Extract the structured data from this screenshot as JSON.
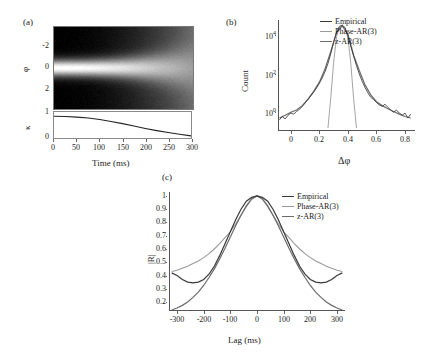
{
  "figure": {
    "panels": [
      {
        "id": "a",
        "label": "(a)"
      },
      {
        "id": "b",
        "label": "(b)"
      },
      {
        "id": "c",
        "label": "(c)"
      }
    ]
  },
  "panel_a": {
    "label": "(a)",
    "phi_axis_title": "φ",
    "kappa_axis_title": "κ",
    "xlabel": "Time (ms)",
    "phi_ticks": [
      "-2",
      "0",
      "2"
    ],
    "kappa_ticks": [
      "0",
      "1"
    ],
    "x_ticks": [
      "0",
      "50",
      "100",
      "150",
      "200",
      "250",
      "300"
    ]
  },
  "panel_b": {
    "label": "(b)",
    "ylabel": "Count",
    "xlabel": "Δφ",
    "y_ticks": [
      "10",
      "10",
      "10"
    ],
    "y_tick_exponents": [
      "0",
      "2",
      "4"
    ],
    "x_ticks": [
      "0",
      "0.2",
      "0.4",
      "0.6",
      "0.8"
    ],
    "legend": [
      {
        "label": "Empirical",
        "color": "#3a3a3a"
      },
      {
        "label": "Phase-AR(3)",
        "color": "#9a9a9a"
      },
      {
        "label": "z-AR(3)",
        "color": "#6b6b6b"
      }
    ]
  },
  "panel_c": {
    "label": "(c)",
    "ylabel": "|R|",
    "xlabel": "Lag (ms)",
    "y_ticks": [
      "1",
      "0.9",
      "0.8",
      "0.7",
      "0.6",
      "0.5",
      "0.4",
      "0.3",
      "0.2"
    ],
    "x_ticks": [
      "-300",
      "-200",
      "-100",
      "0",
      "100",
      "200",
      "300"
    ],
    "legend": [
      {
        "label": "Empirical",
        "color": "#3a3a3a"
      },
      {
        "label": "Phase-AR(3)",
        "color": "#9a9a9a"
      },
      {
        "label": "z-AR(3)",
        "color": "#6b6b6b"
      }
    ]
  },
  "chart_data": [
    {
      "type": "heatmap",
      "panel": "a",
      "title": "",
      "xlabel": "Time (ms)",
      "ylabel": "φ",
      "xlim": [
        0,
        300
      ],
      "ylim": [
        -3.14159,
        3.14159
      ],
      "y_ticks": [
        -2,
        0,
        2
      ],
      "x_ticks": [
        0,
        50,
        100,
        150,
        200,
        250,
        300
      ],
      "colormap": "gray",
      "description": "Phase density over time: bright concentrated band at phi=0 that broadens and fades with increasing time; dark bands near +/- pi edges early on fading to uniform mid-gray by 300 ms.",
      "grid": false
    },
    {
      "type": "line",
      "panel": "a-lower",
      "title": "",
      "xlabel": "Time (ms)",
      "ylabel": "κ",
      "xlim": [
        0,
        300
      ],
      "ylim": [
        0,
        1.15
      ],
      "y_ticks": [
        0,
        1
      ],
      "x_ticks": [
        0,
        50,
        100,
        150,
        200,
        250,
        300
      ],
      "series": [
        {
          "name": "kappa",
          "color": "#222222",
          "x": [
            0,
            25,
            50,
            75,
            100,
            125,
            150,
            175,
            200,
            225,
            250,
            275,
            300
          ],
          "values": [
            1.0,
            0.99,
            0.96,
            0.92,
            0.85,
            0.76,
            0.66,
            0.55,
            0.44,
            0.34,
            0.25,
            0.17,
            0.1
          ]
        }
      ],
      "grid": false
    },
    {
      "type": "line",
      "panel": "b",
      "title": "",
      "xlabel": "Δφ",
      "ylabel": "Count",
      "yscale": "log",
      "xlim": [
        -0.09,
        0.87
      ],
      "ylim": [
        0.12,
        60000
      ],
      "y_ticks": [
        1,
        100,
        10000
      ],
      "y_tick_labels": [
        "10^0",
        "10^2",
        "10^4"
      ],
      "x_ticks": [
        0,
        0.2,
        0.4,
        0.6,
        0.8
      ],
      "legend_position": "top-right",
      "series": [
        {
          "name": "Empirical",
          "color": "#3a3a3a",
          "description": "Noisy heavy-tailed distribution peaking near 3e4 at delta-phi 0.36, tails decaying to order 1 count at the edges",
          "x": [
            -0.08,
            -0.06,
            -0.04,
            -0.02,
            0.0,
            0.02,
            0.04,
            0.06,
            0.08,
            0.1,
            0.12,
            0.14,
            0.16,
            0.18,
            0.2,
            0.22,
            0.24,
            0.26,
            0.28,
            0.3,
            0.32,
            0.34,
            0.36,
            0.38,
            0.4,
            0.42,
            0.44,
            0.46,
            0.48,
            0.5,
            0.52,
            0.54,
            0.56,
            0.58,
            0.6,
            0.62,
            0.64,
            0.66,
            0.68,
            0.7,
            0.72,
            0.74,
            0.76,
            0.78,
            0.8,
            0.82,
            0.84
          ],
          "values": [
            0.4,
            0.6,
            0.45,
            0.7,
            0.9,
            0.8,
            1.1,
            1.4,
            2.0,
            3.0,
            4.5,
            7,
            11,
            18,
            32,
            60,
            130,
            330,
            1100,
            4200,
            14000,
            28000,
            33000,
            24000,
            9000,
            2600,
            800,
            260,
            95,
            40,
            19,
            10,
            6,
            4.5,
            3.2,
            2.4,
            2.0,
            2.6,
            1.8,
            1.3,
            1.0,
            1.3,
            0.9,
            0.7,
            0.9,
            0.5,
            0.8
          ]
        },
        {
          "name": "Phase-AR(3)",
          "color": "#9a9a9a",
          "description": "Narrow nearly-Gaussian peak, falls off vertically near 0.27 and 0.46",
          "x": [
            0.26,
            0.28,
            0.3,
            0.32,
            0.34,
            0.36,
            0.38,
            0.4,
            0.42,
            0.44,
            0.46
          ],
          "values": [
            0.15,
            6,
            400,
            8000,
            26000,
            32000,
            24000,
            7000,
            350,
            5,
            0.15
          ]
        },
        {
          "name": "z-AR(3)",
          "color": "#6b6b6b",
          "description": "Broad heavy-tailed curve closely tracking the empirical distribution",
          "x": [
            -0.08,
            -0.04,
            0.0,
            0.04,
            0.08,
            0.12,
            0.16,
            0.2,
            0.24,
            0.28,
            0.32,
            0.36,
            0.4,
            0.44,
            0.48,
            0.52,
            0.56,
            0.6,
            0.64,
            0.68,
            0.72,
            0.76,
            0.8,
            0.84
          ],
          "values": [
            0.5,
            0.7,
            1.0,
            1.3,
            2.2,
            4.8,
            12,
            36,
            180,
            1400,
            13000,
            30000,
            11000,
            900,
            140,
            26,
            8,
            3.5,
            2.2,
            1.5,
            1.1,
            0.8,
            0.6,
            0.5
          ]
        }
      ],
      "grid": false
    },
    {
      "type": "line",
      "panel": "c",
      "title": "",
      "xlabel": "Lag (ms)",
      "ylabel": "|R|",
      "xlim": [
        -330,
        330
      ],
      "ylim": [
        0.14,
        1.03
      ],
      "y_ticks": [
        0.2,
        0.3,
        0.4,
        0.5,
        0.6,
        0.7,
        0.8,
        0.9,
        1.0
      ],
      "x_ticks": [
        -300,
        -200,
        -100,
        0,
        100,
        200,
        300
      ],
      "legend_position": "top-right",
      "series": [
        {
          "name": "Empirical",
          "color": "#3a3a3a",
          "description": "Peaks at 1 at lag 0, decays and flattens into a shallow trough near +/-250 ms at 0.35 before rising slightly to 0.40 at the edges",
          "x": [
            -320,
            -300,
            -280,
            -260,
            -240,
            -220,
            -200,
            -180,
            -160,
            -140,
            -120,
            -100,
            -80,
            -60,
            -40,
            -20,
            0,
            20,
            40,
            60,
            80,
            100,
            120,
            140,
            160,
            180,
            200,
            220,
            240,
            260,
            280,
            300,
            320
          ],
          "values": [
            0.42,
            0.4,
            0.37,
            0.35,
            0.345,
            0.35,
            0.37,
            0.41,
            0.47,
            0.55,
            0.64,
            0.73,
            0.82,
            0.9,
            0.96,
            0.99,
            1.0,
            0.99,
            0.96,
            0.9,
            0.82,
            0.73,
            0.64,
            0.55,
            0.47,
            0.41,
            0.37,
            0.35,
            0.345,
            0.35,
            0.37,
            0.4,
            0.42
          ]
        },
        {
          "name": "Phase-AR(3)",
          "color": "#9a9a9a",
          "description": "Broadest decay, monotonic, reaching about 0.44 at +/-300 ms",
          "x": [
            -320,
            -300,
            -280,
            -260,
            -240,
            -220,
            -200,
            -180,
            -160,
            -140,
            -120,
            -100,
            -80,
            -60,
            -40,
            -20,
            0,
            20,
            40,
            60,
            80,
            100,
            120,
            140,
            160,
            180,
            200,
            220,
            240,
            260,
            280,
            300,
            320
          ],
          "values": [
            0.43,
            0.44,
            0.455,
            0.47,
            0.49,
            0.51,
            0.535,
            0.565,
            0.6,
            0.64,
            0.685,
            0.73,
            0.79,
            0.855,
            0.92,
            0.975,
            1.0,
            0.975,
            0.92,
            0.855,
            0.79,
            0.73,
            0.685,
            0.64,
            0.6,
            0.565,
            0.535,
            0.51,
            0.49,
            0.47,
            0.455,
            0.44,
            0.43
          ]
        },
        {
          "name": "z-AR(3)",
          "color": "#6b6b6b",
          "description": "Narrowest Gaussian-like decay falling to about 0.15 at +/-300 ms",
          "x": [
            -320,
            -300,
            -280,
            -260,
            -240,
            -220,
            -200,
            -180,
            -160,
            -140,
            -120,
            -100,
            -80,
            -60,
            -40,
            -20,
            0,
            20,
            40,
            60,
            80,
            100,
            120,
            140,
            160,
            180,
            200,
            220,
            240,
            260,
            280,
            300,
            320
          ],
          "values": [
            0.14,
            0.155,
            0.175,
            0.2,
            0.235,
            0.275,
            0.325,
            0.385,
            0.45,
            0.525,
            0.605,
            0.69,
            0.775,
            0.855,
            0.925,
            0.98,
            1.0,
            0.98,
            0.925,
            0.855,
            0.775,
            0.69,
            0.605,
            0.525,
            0.45,
            0.385,
            0.325,
            0.275,
            0.235,
            0.2,
            0.175,
            0.155,
            0.14
          ]
        }
      ],
      "grid": false
    }
  ]
}
